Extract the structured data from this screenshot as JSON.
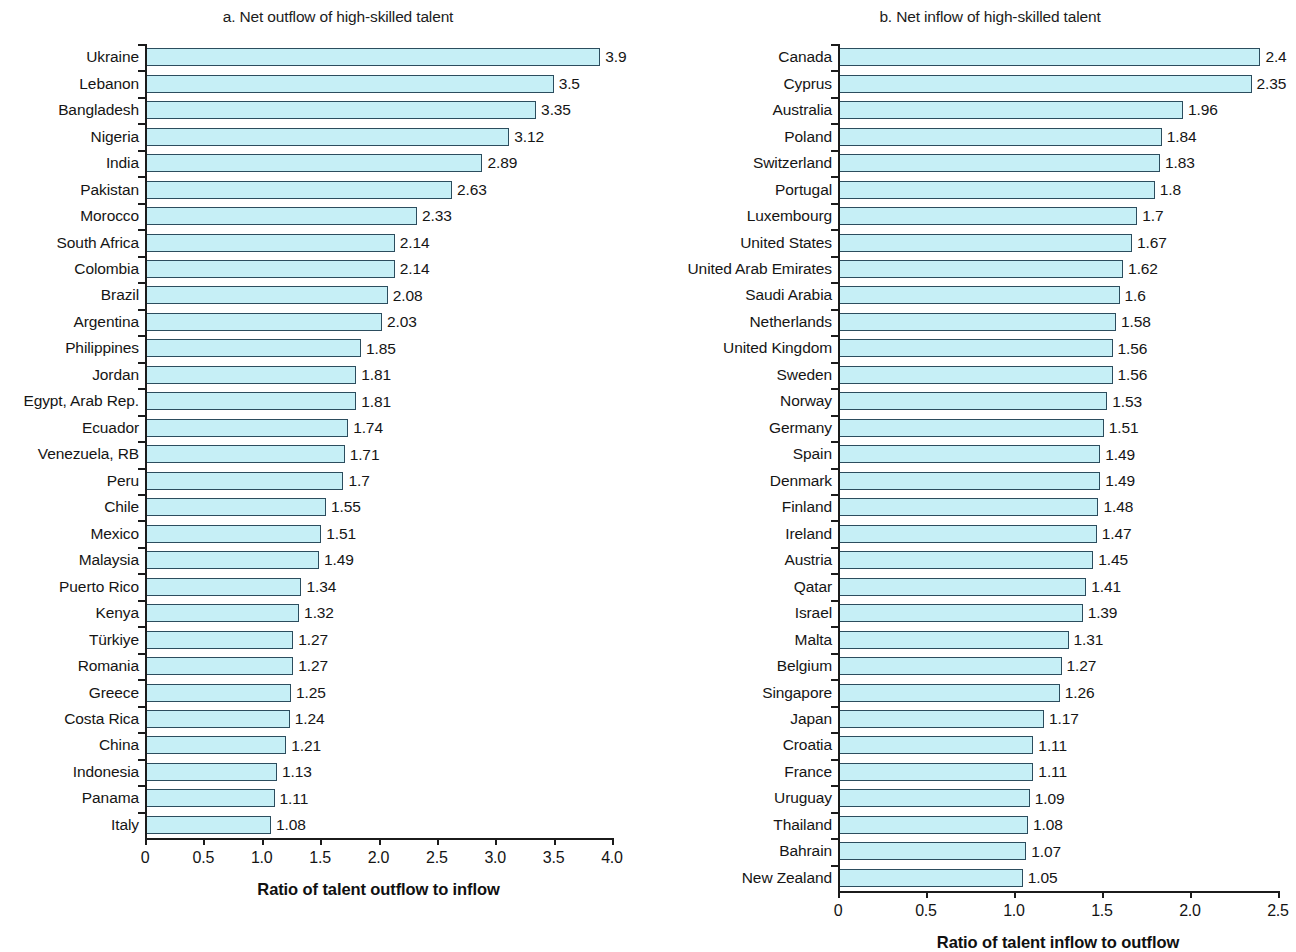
{
  "chart_data": [
    {
      "type": "bar",
      "orientation": "horizontal",
      "panel_id": "a",
      "title": "a. Net outflow of high-skilled talent",
      "xlabel": "Ratio of talent outflow to inflow",
      "ylabel": "",
      "xlim": [
        0,
        4.0
      ],
      "xticks": [
        0,
        0.5,
        1.0,
        1.5,
        2.0,
        2.5,
        3.0,
        3.5,
        4.0
      ],
      "xtick_labels": [
        "0",
        "0.5",
        "1.0",
        "1.5",
        "2.0",
        "2.5",
        "3.0",
        "3.5",
        "4.0"
      ],
      "grid": false,
      "legend": false,
      "bar_color": "#c6eff6",
      "bar_edge_color": "#2c4d5e",
      "categories": [
        "Ukraine",
        "Lebanon",
        "Bangladesh",
        "Nigeria",
        "India",
        "Pakistan",
        "Morocco",
        "South Africa",
        "Colombia",
        "Brazil",
        "Argentina",
        "Philippines",
        "Jordan",
        "Egypt, Arab Rep.",
        "Ecuador",
        "Venezuela, RB",
        "Peru",
        "Chile",
        "Mexico",
        "Malaysia",
        "Puerto Rico",
        "Kenya",
        "Türkiye",
        "Romania",
        "Greece",
        "Costa Rica",
        "China",
        "Indonesia",
        "Panama",
        "Italy"
      ],
      "values": [
        3.9,
        3.5,
        3.35,
        3.12,
        2.89,
        2.63,
        2.33,
        2.14,
        2.14,
        2.08,
        2.03,
        1.85,
        1.81,
        1.81,
        1.74,
        1.71,
        1.7,
        1.55,
        1.51,
        1.49,
        1.34,
        1.32,
        1.27,
        1.27,
        1.25,
        1.24,
        1.21,
        1.13,
        1.11,
        1.08
      ],
      "value_labels": [
        "3.9",
        "3.5",
        "3.35",
        "3.12",
        "2.89",
        "2.63",
        "2.33",
        "2.14",
        "2.14",
        "2.08",
        "2.03",
        "1.85",
        "1.81",
        "1.81",
        "1.74",
        "1.71",
        "1.7",
        "1.55",
        "1.51",
        "1.49",
        "1.34",
        "1.32",
        "1.27",
        "1.27",
        "1.25",
        "1.24",
        "1.21",
        "1.13",
        "1.11",
        "1.08"
      ]
    },
    {
      "type": "bar",
      "orientation": "horizontal",
      "panel_id": "b",
      "title": "b. Net inflow of high-skilled talent",
      "xlabel": "Ratio of talent inflow to outflow",
      "ylabel": "",
      "xlim": [
        0,
        2.5
      ],
      "xticks": [
        0,
        0.5,
        1.0,
        1.5,
        2.0,
        2.5
      ],
      "xtick_labels": [
        "0",
        "0.5",
        "1.0",
        "1.5",
        "2.0",
        "2.5"
      ],
      "grid": false,
      "legend": false,
      "bar_color": "#c6eff6",
      "bar_edge_color": "#2c4d5e",
      "categories": [
        "Canada",
        "Cyprus",
        "Australia",
        "Poland",
        "Switzerland",
        "Portugal",
        "Luxembourg",
        "United States",
        "United Arab Emirates",
        "Saudi Arabia",
        "Netherlands",
        "United Kingdom",
        "Sweden",
        "Norway",
        "Germany",
        "Spain",
        "Denmark",
        "Finland",
        "Ireland",
        "Austria",
        "Qatar",
        "Israel",
        "Malta",
        "Belgium",
        "Singapore",
        "Japan",
        "Croatia",
        "France",
        "Uruguay",
        "Thailand",
        "Bahrain",
        "New Zealand"
      ],
      "values": [
        2.4,
        2.35,
        1.96,
        1.84,
        1.83,
        1.8,
        1.7,
        1.67,
        1.62,
        1.6,
        1.58,
        1.56,
        1.56,
        1.53,
        1.51,
        1.49,
        1.49,
        1.48,
        1.47,
        1.45,
        1.41,
        1.39,
        1.31,
        1.27,
        1.26,
        1.17,
        1.11,
        1.11,
        1.09,
        1.08,
        1.07,
        1.05
      ],
      "value_labels": [
        "2.4",
        "2.35",
        "1.96",
        "1.84",
        "1.83",
        "1.8",
        "1.7",
        "1.67",
        "1.62",
        "1.6",
        "1.58",
        "1.56",
        "1.56",
        "1.53",
        "1.51",
        "1.49",
        "1.49",
        "1.48",
        "1.47",
        "1.45",
        "1.41",
        "1.39",
        "1.31",
        "1.27",
        "1.26",
        "1.17",
        "1.11",
        "1.11",
        "1.09",
        "1.08",
        "1.07",
        "1.05"
      ]
    }
  ]
}
